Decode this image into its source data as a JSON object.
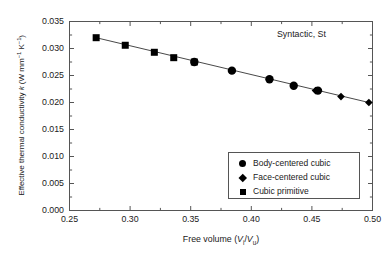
{
  "annotation": "Syntactic, St",
  "axes": {
    "xlabel_prefix": "Free volume (",
    "xlabel_v1": "V",
    "xlabel_sub1": "i",
    "xlabel_slash": "/",
    "xlabel_v2": "V",
    "xlabel_sub2": "u",
    "xlabel_suffix": ")",
    "ylabel_main": "Effective thermal conductivity ",
    "ylabel_k": "k",
    "ylabel_unit_open": " (W mm",
    "ylabel_exp1": "−1",
    "ylabel_mid": " K",
    "ylabel_exp2": "−1",
    "ylabel_unit_close": ")",
    "xticks": [
      "0.25",
      "0.30",
      "0.35",
      "0.40",
      "0.45",
      "0.50"
    ],
    "yticks": [
      "0.000",
      "0.005",
      "0.010",
      "0.015",
      "0.020",
      "0.025",
      "0.030",
      "0.035"
    ]
  },
  "legend": {
    "items": [
      {
        "label": "Body-centered cubic",
        "marker": "circle"
      },
      {
        "label": "Face-centered cubic",
        "marker": "diamond"
      },
      {
        "label": "Cubic primitive",
        "marker": "square"
      }
    ]
  },
  "colors": {
    "marker": "#000000",
    "line": "#333333",
    "frame": "#555555",
    "text": "#1a1a1a",
    "background": "#ffffff"
  },
  "chart_data": {
    "type": "scatter",
    "title": "",
    "subtitle": "",
    "annotation": "Syntactic, St",
    "xlabel": "Free volume (Vi/Vu)",
    "ylabel": "Effective thermal conductivity k (W mm^-1 K^-1)",
    "xlim": [
      0.25,
      0.5
    ],
    "ylim": [
      0.0,
      0.035
    ],
    "xticks": [
      0.25,
      0.3,
      0.35,
      0.4,
      0.45,
      0.5
    ],
    "yticks": [
      0.0,
      0.005,
      0.01,
      0.015,
      0.02,
      0.025,
      0.03,
      0.035
    ],
    "minor_ticks": true,
    "grid": false,
    "legend_position": "lower-right",
    "trendline": {
      "x": [
        0.272,
        0.497
      ],
      "y": [
        0.032,
        0.02
      ]
    },
    "series": [
      {
        "name": "Cubic primitive",
        "marker": "square",
        "x": [
          0.272,
          0.296,
          0.32,
          0.336,
          0.353
        ],
        "y": [
          0.032,
          0.0306,
          0.0293,
          0.0283,
          0.0275
        ]
      },
      {
        "name": "Body-centered cubic",
        "marker": "circle",
        "x": [
          0.353,
          0.384,
          0.415,
          0.435,
          0.455
        ],
        "y": [
          0.0275,
          0.0259,
          0.0243,
          0.0231,
          0.0222
        ]
      },
      {
        "name": "Face-centered cubic",
        "marker": "diamond",
        "x": [
          0.453,
          0.474,
          0.497
        ],
        "y": [
          0.0222,
          0.0211,
          0.02
        ]
      }
    ]
  }
}
